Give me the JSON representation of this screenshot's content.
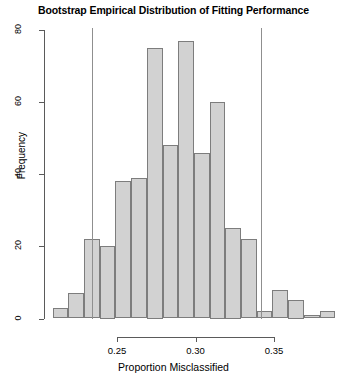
{
  "chart_data": {
    "type": "bar",
    "title": "Bootstrap Empirical Distribution of Fitting Performance",
    "xlabel": "Proportion Misclassified",
    "ylabel": "Frequency",
    "xlim": [
      0.2045,
      0.3805
    ],
    "ylim": [
      0,
      80
    ],
    "grid": false,
    "legend": null,
    "bin_width": 0.01,
    "xticks": [
      0.25,
      0.3,
      0.35
    ],
    "xtick_labels": [
      "0.25",
      "0.30",
      "0.35"
    ],
    "yticks": [
      0,
      20,
      40,
      60,
      80
    ],
    "ytick_labels": [
      "0",
      "20",
      "40",
      "60",
      "80"
    ],
    "bin_starts": [
      0.209,
      0.219,
      0.229,
      0.239,
      0.249,
      0.259,
      0.269,
      0.279,
      0.289,
      0.299,
      0.309,
      0.319,
      0.329,
      0.339,
      0.349,
      0.359,
      0.369,
      0.379
    ],
    "values": [
      3,
      7,
      22,
      20,
      38,
      39,
      75,
      48,
      77,
      46,
      60,
      25,
      22,
      2,
      8,
      5,
      1,
      2
    ],
    "annotations": [
      {
        "type": "vertical-line",
        "x": 0.2341,
        "name": "lower-confidence-bound"
      },
      {
        "type": "vertical-line",
        "x": 0.3417,
        "name": "upper-confidence-bound"
      }
    ],
    "bar_fill_color": "#d2d2d2",
    "bar_border_color": "#7d7d7d",
    "annotation_line_color": "#8f8f8f"
  }
}
